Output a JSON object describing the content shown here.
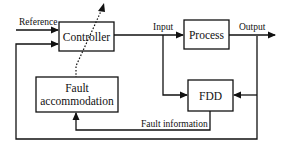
{
  "diagram": {
    "title": "",
    "blocks": {
      "controller": {
        "label": "Controller"
      },
      "process": {
        "label": "Process"
      },
      "fault_accommodation": {
        "line1": "Fault",
        "line2": "accommodation"
      },
      "fdd": {
        "label": "FDD"
      }
    },
    "signals": {
      "reference": "Reference",
      "input": "Input",
      "output": "Output",
      "fault_information": "Fault information"
    },
    "colors": {
      "stroke": "#111111",
      "background": "#ffffff"
    }
  }
}
